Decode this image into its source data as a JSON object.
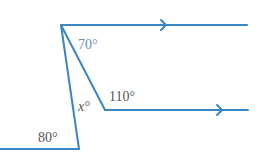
{
  "diagram": {
    "title": "",
    "colors": {
      "line": "#3a86c4",
      "label_gray": "#555555",
      "label_blue": "#6a8fb0"
    },
    "labels": {
      "angle_top": "70°",
      "angle_right": "110°",
      "angle_unknown": "x°",
      "angle_bottom": "80°"
    },
    "parallel_marks": [
      "arrow-top-line",
      "arrow-lower-line"
    ]
  }
}
